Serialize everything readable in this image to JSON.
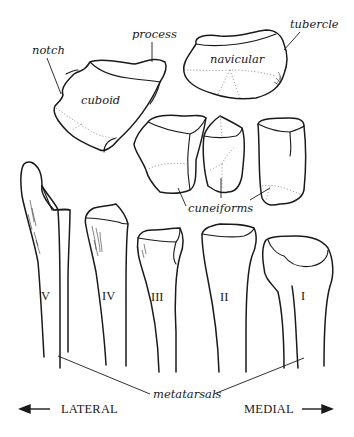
{
  "figure": {
    "labels": {
      "notch": "notch",
      "process": "process",
      "cuboid": "cuboid",
      "navicular": "navicular",
      "tubercle": "tubercle",
      "cuneiforms": "cuneiforms",
      "metatarsals": "metatarsals"
    },
    "metatarsal_numerals": [
      "V",
      "IV",
      "III",
      "II",
      "I"
    ],
    "orientation": {
      "left": "LATERAL",
      "right": "MEDIAL"
    },
    "colors": {
      "line": "#1a1a1a",
      "background": "#ffffff"
    }
  }
}
